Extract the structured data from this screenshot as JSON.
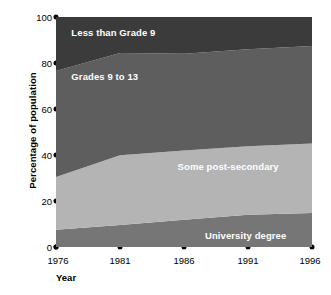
{
  "chart_data": {
    "type": "area",
    "stacked": true,
    "title": "",
    "xlabel": "Year",
    "ylabel": "Percentage of population",
    "x": [
      1976,
      1981,
      1986,
      1991,
      1996
    ],
    "xlim": [
      1976,
      1996
    ],
    "ylim": [
      0,
      100
    ],
    "xticks": [
      "1976",
      "1981",
      "1986",
      "1991",
      "1996"
    ],
    "yticks": [
      "0",
      "20",
      "40",
      "60",
      "80",
      "100"
    ],
    "grid": false,
    "legend_position": "inline-labels",
    "series": [
      {
        "name": "University degree",
        "order": 1,
        "color": "#767676",
        "values": [
          7.5,
          9.6,
          11.8,
          14.0,
          14.8
        ],
        "label_x": 1994.0,
        "label_y": 5.0
      },
      {
        "name": "Some post-secondary",
        "order": 2,
        "color": "#b4b4b4",
        "values": [
          22.9,
          30.3,
          30.2,
          29.8,
          30.2
        ],
        "label_x": 1993.4,
        "label_y": 35.0
      },
      {
        "name": "Grades 9 to 13",
        "order": 3,
        "color": "#5e5e5e",
        "values": [
          46.1,
          44.5,
          42.0,
          42.2,
          42.4
        ],
        "label_x": 1977.2,
        "label_y": 74.0
      },
      {
        "name": "Less than Grade 9",
        "order": 4,
        "color": "#3b3b3b",
        "values": [
          23.5,
          15.6,
          16.0,
          14.0,
          12.6
        ],
        "label_x": 1977.2,
        "label_y": 93.0
      }
    ],
    "cumulative_tops": {
      "University degree": [
        7.5,
        9.6,
        11.8,
        14.0,
        14.8
      ],
      "Some post-secondary": [
        30.4,
        39.9,
        42.0,
        43.8,
        45.0
      ],
      "Grades 9 to 13": [
        76.5,
        84.4,
        84.0,
        86.0,
        87.4
      ],
      "Less than Grade 9": [
        100,
        100,
        100,
        100,
        100
      ]
    }
  },
  "axes": {
    "y_title": "Percentage of population",
    "x_title": "Year"
  }
}
